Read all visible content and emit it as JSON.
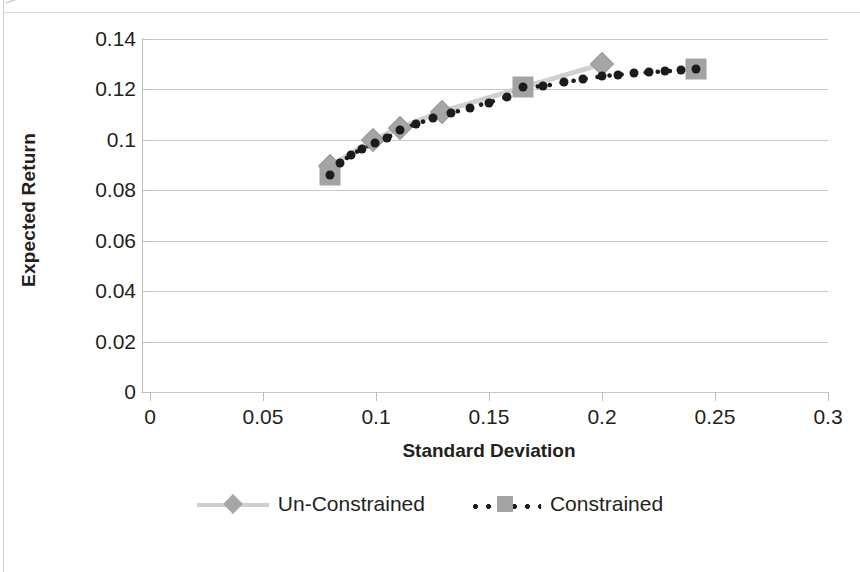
{
  "chart_data": {
    "type": "scatter",
    "title": "",
    "xlabel": "Standard Deviation",
    "ylabel": "Expected Return",
    "xlim": [
      0,
      0.3
    ],
    "ylim": [
      0,
      0.14
    ],
    "xticks": [
      "0",
      "0.05",
      "0.1",
      "0.15",
      "0.2",
      "0.25",
      "0.3"
    ],
    "xtick_values": [
      0,
      0.05,
      0.1,
      0.15,
      0.2,
      0.25,
      0.3
    ],
    "yticks": [
      "0",
      "0.02",
      "0.04",
      "0.06",
      "0.08",
      "0.1",
      "0.12",
      "0.14"
    ],
    "ytick_values": [
      0,
      0.02,
      0.04,
      0.06,
      0.08,
      0.1,
      0.12,
      0.14
    ],
    "grid": "horizontal",
    "legend_position": "bottom",
    "series": [
      {
        "name": "Un-Constrained",
        "marker": "diamond",
        "color": "#a6a6a6",
        "line_style": "solid",
        "points": [
          {
            "x": 0.0795,
            "y": 0.0895
          },
          {
            "x": 0.0985,
            "y": 0.0998
          },
          {
            "x": 0.1105,
            "y": 0.1048
          },
          {
            "x": 0.129,
            "y": 0.1112
          },
          {
            "x": 0.2,
            "y": 0.13
          }
        ]
      },
      {
        "name": "Constrained",
        "marker": "square",
        "color": "#a3a3a3",
        "line_style": "dotted",
        "line_color": "#1b1b1b",
        "points": [
          {
            "x": 0.0795,
            "y": 0.0862
          },
          {
            "x": 0.0842,
            "y": 0.091
          },
          {
            "x": 0.089,
            "y": 0.094
          },
          {
            "x": 0.094,
            "y": 0.0965
          },
          {
            "x": 0.0995,
            "y": 0.0988
          },
          {
            "x": 0.105,
            "y": 0.1008
          },
          {
            "x": 0.1105,
            "y": 0.104
          },
          {
            "x": 0.1175,
            "y": 0.1062
          },
          {
            "x": 0.125,
            "y": 0.1085
          },
          {
            "x": 0.133,
            "y": 0.1105
          },
          {
            "x": 0.1415,
            "y": 0.1128
          },
          {
            "x": 0.15,
            "y": 0.1148
          },
          {
            "x": 0.158,
            "y": 0.117
          },
          {
            "x": 0.165,
            "y": 0.1208
          },
          {
            "x": 0.174,
            "y": 0.1213
          },
          {
            "x": 0.183,
            "y": 0.1228
          },
          {
            "x": 0.1915,
            "y": 0.124
          },
          {
            "x": 0.2,
            "y": 0.1252
          },
          {
            "x": 0.207,
            "y": 0.1258
          },
          {
            "x": 0.214,
            "y": 0.1264
          },
          {
            "x": 0.221,
            "y": 0.1268
          },
          {
            "x": 0.228,
            "y": 0.1272
          },
          {
            "x": 0.235,
            "y": 0.1276
          },
          {
            "x": 0.2416,
            "y": 0.128
          }
        ]
      }
    ]
  },
  "axes": {
    "y_title": "Expected Return",
    "x_title": "Standard Deviation"
  },
  "legend": {
    "items": [
      {
        "label": "Un-Constrained",
        "marker": "diamond-marker",
        "line": "solid-line"
      },
      {
        "label": "Constrained",
        "marker": "square-marker",
        "line": "dotted-line"
      }
    ]
  }
}
